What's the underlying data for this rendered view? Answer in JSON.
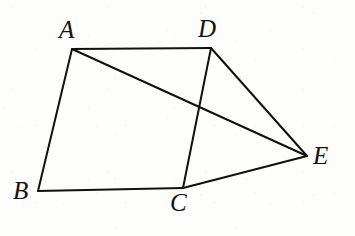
{
  "figure": {
    "kind": "euclidean-geometry-diagram",
    "background_color": "#fdfdfc",
    "ink_color": "#101010",
    "stroke_width": 2,
    "canvas": {
      "width": 355,
      "height": 236
    },
    "points": [
      {
        "id": "A",
        "label": "A",
        "x": 72,
        "y": 49,
        "label_x": 59,
        "label_y": 17
      },
      {
        "id": "B",
        "label": "B",
        "x": 38,
        "y": 191,
        "label_x": 13,
        "label_y": 178
      },
      {
        "id": "C",
        "label": "C",
        "x": 183,
        "y": 188,
        "label_x": 170,
        "label_y": 190
      },
      {
        "id": "D",
        "label": "D",
        "x": 211,
        "y": 48,
        "label_x": 198,
        "label_y": 16
      },
      {
        "id": "E",
        "label": "E",
        "x": 307,
        "y": 156,
        "label_x": 313,
        "label_y": 143
      }
    ],
    "segments": [
      {
        "id": "AD",
        "from": "A",
        "to": "D",
        "name": "segment-ad"
      },
      {
        "id": "AB",
        "from": "A",
        "to": "B",
        "name": "segment-ab"
      },
      {
        "id": "BC",
        "from": "B",
        "to": "C",
        "name": "segment-bc"
      },
      {
        "id": "DC",
        "from": "D",
        "to": "C",
        "name": "segment-dc"
      },
      {
        "id": "DE",
        "from": "D",
        "to": "E",
        "name": "segment-de"
      },
      {
        "id": "CE",
        "from": "C",
        "to": "E",
        "name": "segment-ce"
      },
      {
        "id": "AE",
        "from": "A",
        "to": "E",
        "name": "segment-ae-diagonal"
      }
    ],
    "intersections": [
      {
        "id": "AE_x_DC",
        "of": [
          "AE",
          "DC"
        ],
        "x": 200,
        "y": 108
      }
    ]
  }
}
